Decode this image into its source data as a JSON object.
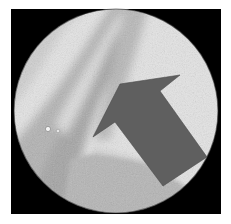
{
  "image": {
    "alt": "Circular microscopy field of view of a histology tissue section in grayscale, with a large dark gray arrow pointing up-left toward a tissue fold",
    "background_color": "#ffffff",
    "frame_color": "#000000",
    "field_bright_color": "#e6e6e6",
    "tissue_light_color": "#c9c9c9",
    "tissue_mid_color": "#a8a8a8",
    "tissue_dark_color": "#8a8a8a",
    "arrow": {
      "color": "#5f5f5f",
      "direction": "up-left"
    },
    "field_of_view": {
      "shape": "circle",
      "center_x": 116,
      "center_y": 111,
      "radius": 102
    }
  }
}
